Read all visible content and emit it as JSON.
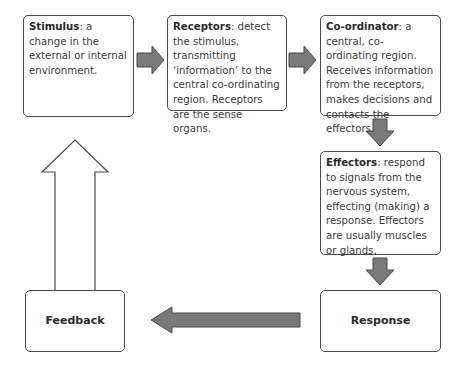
{
  "diagram": {
    "type": "flowchart",
    "title": "",
    "nodes": [
      {
        "id": "stimulus",
        "label": "Stimulus",
        "desc": ": a change in the external or internal environment."
      },
      {
        "id": "receptors",
        "label": "Receptors",
        "desc": ": detect the stimulus, transmitting ‘information’ to the central co-ordinating region. Receptors are the sense organs."
      },
      {
        "id": "coordinator",
        "label": "Co-ordinator",
        "desc": ": a central, co-ordinating region. Receives information from the receptors, makes decisions and contacts the effectors."
      },
      {
        "id": "effectors",
        "label": "Effectors",
        "desc": ": respond to signals from the nervous system, effecting (making) a response. Effectors are usually muscles or glands."
      },
      {
        "id": "response",
        "label": "Response",
        "desc": ""
      },
      {
        "id": "feedback",
        "label": "Feedback",
        "desc": ""
      }
    ],
    "edges": [
      {
        "from": "stimulus",
        "to": "receptors",
        "style": "filled-grey"
      },
      {
        "from": "receptors",
        "to": "coordinator",
        "style": "filled-grey"
      },
      {
        "from": "coordinator",
        "to": "effectors",
        "style": "filled-grey"
      },
      {
        "from": "effectors",
        "to": "response",
        "style": "filled-grey"
      },
      {
        "from": "response",
        "to": "feedback",
        "style": "filled-grey"
      },
      {
        "from": "feedback",
        "to": "stimulus",
        "style": "outline"
      }
    ],
    "colors": {
      "arrow_fill": "#7a7a7a",
      "arrow_stroke": "#4a4a4a",
      "box_border": "#4a4a4a",
      "text": "#333333"
    }
  }
}
